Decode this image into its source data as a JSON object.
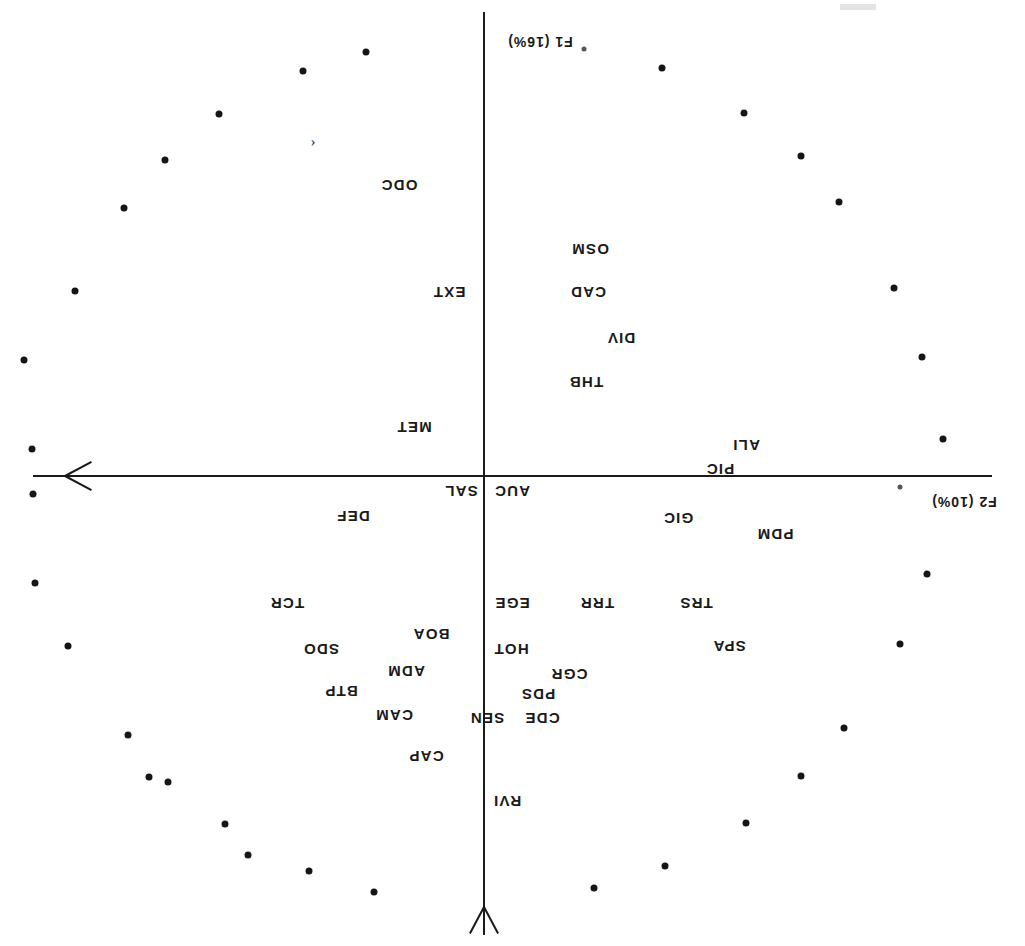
{
  "figure": {
    "kind": "pca-correlation-circle",
    "orientation": "rotated-180",
    "background": "#ffffff",
    "ink_color": "#1a1a1a"
  },
  "axes": {
    "horizontal": {
      "name": "F2",
      "label": "F2 (10%)",
      "variance_pct": 10,
      "arrow_direction": "left"
    },
    "vertical": {
      "name": "F1",
      "label": "F1 (16%)",
      "variance_pct": 16,
      "arrow_direction": "down"
    }
  },
  "chart_data": {
    "type": "scatter",
    "title": "",
    "xlabel": "F2 (10%)",
    "ylabel": "F1 (16%)",
    "xlim": [
      -1,
      1
    ],
    "ylim": [
      -1,
      1
    ],
    "grid": false,
    "legend": "none",
    "note": "Correlation circle: variable labels plotted inside a dotted unit-circle perimeter. Coordinates below are in plot pixel space (origin at 541,470).",
    "labels": [
      {
        "text": "RVI",
        "x": 518,
        "y": 145
      },
      {
        "text": "CAP",
        "x": 599,
        "y": 190
      },
      {
        "text": "CDE",
        "x": 483,
        "y": 228
      },
      {
        "text": "SEN",
        "x": 538,
        "y": 228
      },
      {
        "text": "CAM",
        "x": 631,
        "y": 231
      },
      {
        "text": "PDS",
        "x": 487,
        "y": 252
      },
      {
        "text": "BTP",
        "x": 684,
        "y": 255
      },
      {
        "text": "CGR",
        "x": 456,
        "y": 272
      },
      {
        "text": "ADM",
        "x": 619,
        "y": 275
      },
      {
        "text": "SPA",
        "x": 296,
        "y": 300
      },
      {
        "text": "HOT",
        "x": 514,
        "y": 297
      },
      {
        "text": "SDO",
        "x": 704,
        "y": 297
      },
      {
        "text": "BOA",
        "x": 594,
        "y": 312
      },
      {
        "text": "TRS",
        "x": 329,
        "y": 343
      },
      {
        "text": "TRR",
        "x": 428,
        "y": 343
      },
      {
        "text": "EGE",
        "x": 513,
        "y": 343
      },
      {
        "text": "TCR",
        "x": 738,
        "y": 343
      },
      {
        "text": "PDM",
        "x": 250,
        "y": 412
      },
      {
        "text": "GIC",
        "x": 347,
        "y": 428
      },
      {
        "text": "DEF",
        "x": 672,
        "y": 430
      },
      {
        "text": "AUC",
        "x": 513,
        "y": 455
      },
      {
        "text": "SAL",
        "x": 564,
        "y": 455
      },
      {
        "text": "PIC",
        "x": 305,
        "y": 477
      },
      {
        "text": "ALI",
        "x": 279,
        "y": 501
      },
      {
        "text": "MET",
        "x": 611,
        "y": 519
      },
      {
        "text": "THB",
        "x": 439,
        "y": 564
      },
      {
        "text": "DIV",
        "x": 404,
        "y": 608
      },
      {
        "text": "CAD",
        "x": 437,
        "y": 654
      },
      {
        "text": "EXT",
        "x": 576,
        "y": 654
      },
      {
        "text": "OSM",
        "x": 435,
        "y": 697
      },
      {
        "text": "ODC",
        "x": 626,
        "y": 761
      }
    ],
    "perimeter_points": [
      {
        "x": 431,
        "y": 58
      },
      {
        "x": 360,
        "y": 80
      },
      {
        "x": 651,
        "y": 54
      },
      {
        "x": 716,
        "y": 75
      },
      {
        "x": 777,
        "y": 91
      },
      {
        "x": 800,
        "y": 122
      },
      {
        "x": 279,
        "y": 123
      },
      {
        "x": 857,
        "y": 164
      },
      {
        "x": 224,
        "y": 170
      },
      {
        "x": 876,
        "y": 169
      },
      {
        "x": 181,
        "y": 218
      },
      {
        "x": 897,
        "y": 211
      },
      {
        "x": 125,
        "y": 302
      },
      {
        "x": 957,
        "y": 300
      },
      {
        "x": 98,
        "y": 372
      },
      {
        "x": 990,
        "y": 363
      },
      {
        "x": 992,
        "y": 452
      },
      {
        "x": 82,
        "y": 507
      },
      {
        "x": 993,
        "y": 497
      },
      {
        "x": 103,
        "y": 589
      },
      {
        "x": 1001,
        "y": 586
      },
      {
        "x": 131,
        "y": 658
      },
      {
        "x": 950,
        "y": 655
      },
      {
        "x": 186,
        "y": 744
      },
      {
        "x": 901,
        "y": 738
      },
      {
        "x": 224,
        "y": 790
      },
      {
        "x": 860,
        "y": 786
      },
      {
        "x": 281,
        "y": 833
      },
      {
        "x": 806,
        "y": 832
      },
      {
        "x": 363,
        "y": 878
      },
      {
        "x": 722,
        "y": 875
      },
      {
        "x": 659,
        "y": 894
      }
    ]
  },
  "artifacts": {
    "partial_glyph": "‹",
    "speck_note": "dust specks near axis labels"
  }
}
